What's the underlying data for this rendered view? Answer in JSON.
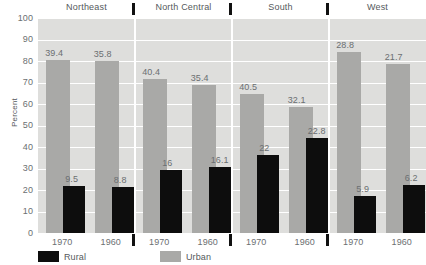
{
  "chart_data": {
    "type": "bar",
    "title": "",
    "subtitle": "",
    "xlabel": "",
    "ylabel": "Percent",
    "ylim": [
      0,
      100
    ],
    "yticks": [
      100,
      90,
      80,
      70,
      60,
      50,
      40,
      30,
      20,
      10,
      0
    ],
    "grid": true,
    "legend_position": "bottom",
    "legend": [
      {
        "name": "Rural",
        "color": "#0d0d0d"
      },
      {
        "name": "Urban",
        "color": "#a9a9a7"
      }
    ],
    "panels": [
      {
        "name": "Northeast",
        "categories": [
          "1970",
          "1960"
        ],
        "series": [
          {
            "name": "Urban",
            "values": [
              80.4,
              80.2
            ],
            "labels": [
              "39.4",
              "35.8"
            ]
          },
          {
            "name": "Rural",
            "values": [
              21.8,
              21.2
            ],
            "labels": [
              "9.5",
              "8.8"
            ]
          }
        ]
      },
      {
        "name": "North Central",
        "categories": [
          "1970",
          "1960"
        ],
        "series": [
          {
            "name": "Urban",
            "values": [
              71.6,
              68.7
            ],
            "labels": [
              "40.4",
              "35.4"
            ]
          },
          {
            "name": "Rural",
            "values": [
              29.4,
              30.8
            ],
            "labels": [
              "16",
              "16.1"
            ]
          }
        ]
      },
      {
        "name": "South",
        "categories": [
          "1970",
          "1960"
        ],
        "series": [
          {
            "name": "Urban",
            "values": [
              64.6,
              58.4
            ],
            "labels": [
              "40.5",
              "32.1"
            ]
          },
          {
            "name": "Rural",
            "values": [
              36.4,
              44.0
            ],
            "labels": [
              "22",
              "22.8"
            ]
          }
        ]
      },
      {
        "name": "West",
        "categories": [
          "1970",
          "1960"
        ],
        "series": [
          {
            "name": "Urban",
            "values": [
              84.0,
              78.6
            ],
            "labels": [
              "28.8",
              "21.7"
            ]
          },
          {
            "name": "Rural",
            "values": [
              17.1,
              22.2
            ],
            "labels": [
              "5.9",
              "6.2"
            ]
          }
        ]
      }
    ]
  }
}
